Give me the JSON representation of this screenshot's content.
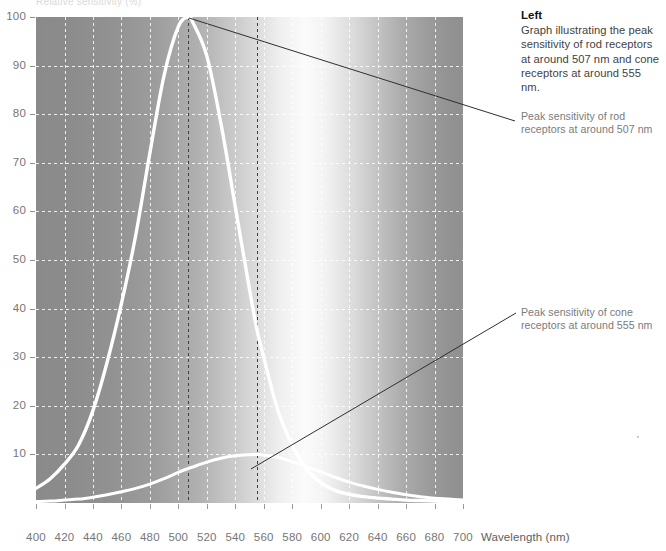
{
  "figure": {
    "header_faint": "Relative sensitivity (%)",
    "note": {
      "title": "Left",
      "body": "Graph illustrating the peak sensitivity of rod receptors at around 507 nm and cone receptors at around 555 nm."
    },
    "callouts": [
      {
        "id": "rod",
        "text": "Peak sensitivity of rod receptors at around 507 nm"
      },
      {
        "id": "cone",
        "text": "Peak sensitivity of cone receptors at around 555 nm"
      }
    ]
  },
  "chart_data": {
    "type": "line",
    "title": "",
    "xlabel": "Wavelength (nm)",
    "ylabel": "",
    "xlim": [
      400,
      700
    ],
    "ylim": [
      0,
      100
    ],
    "xticks": [
      400,
      420,
      440,
      460,
      480,
      500,
      520,
      540,
      560,
      580,
      600,
      620,
      640,
      660,
      680,
      700
    ],
    "yticks": [
      10,
      20,
      30,
      40,
      50,
      60,
      70,
      80,
      90,
      100
    ],
    "grid": true,
    "legend": "none",
    "background": "visible-spectrum luminance gradient (dark grey at 400 nm, brightest near 555 nm, dark grey at 700 nm)",
    "x": [
      400,
      410,
      420,
      430,
      440,
      450,
      460,
      470,
      480,
      490,
      500,
      507,
      510,
      520,
      530,
      540,
      550,
      555,
      560,
      570,
      580,
      590,
      600,
      610,
      620,
      630,
      640,
      650,
      660,
      670,
      680,
      690,
      700
    ],
    "series": [
      {
        "name": "Rod receptors (scotopic)",
        "color": "#ffffff",
        "peak_x": 507,
        "peak_y": 100,
        "values": [
          3,
          5,
          8,
          12,
          19,
          29,
          41,
          55,
          72,
          88,
          98,
          100,
          99,
          92,
          78,
          61,
          44,
          36,
          30,
          19,
          12,
          7,
          4.2,
          2.6,
          1.8,
          1.3,
          1.0,
          0.8,
          0.6,
          0.5,
          0.4,
          0.3,
          0.3
        ]
      },
      {
        "name": "Cone receptors (photopic)",
        "color": "#ffffff",
        "peak_x": 555,
        "peak_y": 10,
        "values": [
          0.3,
          0.4,
          0.6,
          0.8,
          1.2,
          1.7,
          2.3,
          3.0,
          3.9,
          5.0,
          6.3,
          7.1,
          7.4,
          8.4,
          9.2,
          9.7,
          9.95,
          10.0,
          9.9,
          9.4,
          8.5,
          7.5,
          6.4,
          5.3,
          4.3,
          3.5,
          2.8,
          2.2,
          1.7,
          1.3,
          1.0,
          0.8,
          0.6
        ]
      }
    ],
    "annotations": [
      {
        "label": "Peak sensitivity of rod receptors at around 507 nm",
        "point_x": 507,
        "point_y": 100
      },
      {
        "label": "Peak sensitivity of cone receptors at around 555 nm",
        "point_x": 555,
        "point_y": 10
      }
    ],
    "marker_lines": [
      {
        "at_x": 507,
        "style": "dashed-dark"
      },
      {
        "at_x": 555,
        "style": "dashed-dark"
      }
    ]
  }
}
